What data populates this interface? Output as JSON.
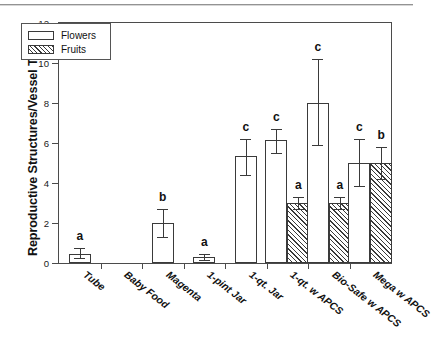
{
  "chart_data": {
    "type": "bar",
    "title": "",
    "xlabel": "",
    "ylabel": "Reproductive Structures/Vessel Type",
    "ylim": [
      0,
      12
    ],
    "yticks": [
      0,
      2,
      4,
      6,
      8,
      10,
      12
    ],
    "grid": false,
    "legend_position": "top-left",
    "categories": [
      "Tube",
      "Baby Food",
      "Magenta",
      "1-pint Jar",
      "1-qt. Jar",
      "1-qt. w APCS",
      "Bio-Safe w APCS",
      "Mega w APCS"
    ],
    "series": [
      {
        "name": "Flowers",
        "fill": "open",
        "values": [
          0.45,
          0.0,
          2.0,
          0.3,
          5.35,
          6.15,
          8.0,
          5.0
        ],
        "err_low": [
          0.2,
          0.0,
          0.7,
          0.15,
          0.95,
          0.65,
          2.1,
          1.15
        ],
        "err_high": [
          0.3,
          0.0,
          0.7,
          0.15,
          0.85,
          0.55,
          2.2,
          1.2
        ],
        "sig_letters": [
          "a",
          "",
          "b",
          "a",
          "c",
          "c",
          "c",
          "c"
        ]
      },
      {
        "name": "Fruits",
        "fill": "hatched",
        "values": [
          null,
          null,
          null,
          null,
          null,
          3.0,
          3.0,
          5.0
        ],
        "err_low": [
          null,
          null,
          null,
          null,
          null,
          0.3,
          0.3,
          0.8
        ],
        "err_high": [
          null,
          null,
          null,
          null,
          null,
          0.3,
          0.3,
          0.8
        ],
        "sig_letters": [
          "",
          "",
          "",
          "",
          "",
          "a",
          "a",
          "b"
        ]
      }
    ]
  },
  "axis": {
    "y_title": "Reproductive Structures/Vessel Type",
    "tick_0": "0",
    "tick_2": "2",
    "tick_4": "4",
    "tick_6": "6",
    "tick_8": "8",
    "tick_10": "10",
    "tick_12": "12"
  },
  "legend": {
    "flowers_label": "Flowers",
    "fruits_label": "Fruits"
  },
  "xlabels": {
    "c0": "Tube",
    "c1": "Baby Food",
    "c2": "Magenta",
    "c3": "1-pint Jar",
    "c4": "1-qt. Jar",
    "c5": "1-qt. w APCS",
    "c6": "Bio-Safe w APCS",
    "c7": "Mega w APCS"
  },
  "sig": {
    "s0": "a",
    "s2": "b",
    "s3": "a",
    "s4": "c",
    "s5f": "c",
    "s5r": "a",
    "s6f": "c",
    "s6r": "a",
    "s7f": "c",
    "s7r": "b"
  },
  "colors": {
    "ink": "#3a3a3a",
    "frame": "#4b4b4b",
    "text": "#111111",
    "background": "#ffffff"
  }
}
